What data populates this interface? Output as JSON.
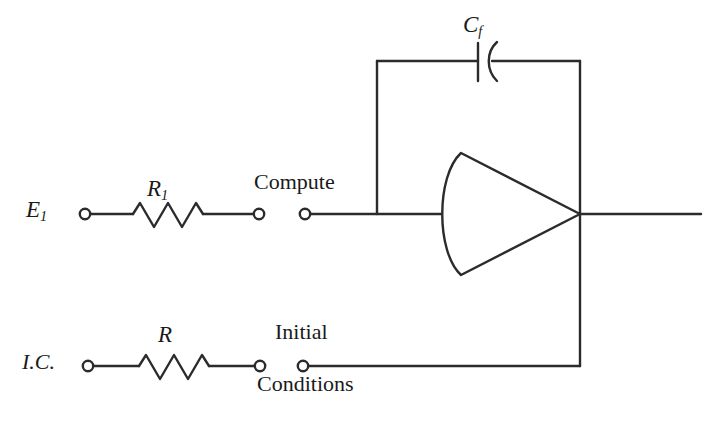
{
  "diagram": {
    "stroke_color": "#2b2b2b",
    "background_color": "#ffffff",
    "labels": {
      "input_source": "E",
      "input_source_sub": "1",
      "input_resistor": "R",
      "input_resistor_sub": "1",
      "ic_resistor": "R",
      "feedback_capacitor": "C",
      "feedback_capacitor_sub": "f",
      "ic_source": "I.C.",
      "compute_switch": "Compute",
      "initial_switch_line1": "Initial",
      "initial_switch_line2": "Conditions"
    },
    "components": [
      {
        "name": "input-source-terminal",
        "type": "terminal",
        "label": "E1"
      },
      {
        "name": "input-resistor",
        "type": "resistor",
        "label": "R1"
      },
      {
        "name": "compute-switch",
        "type": "open-switch",
        "label": "Compute"
      },
      {
        "name": "feedback-capacitor",
        "type": "capacitor",
        "label": "Cf"
      },
      {
        "name": "operational-amplifier",
        "type": "amplifier",
        "label": ""
      },
      {
        "name": "ic-source-terminal",
        "type": "terminal",
        "label": "I.C."
      },
      {
        "name": "ic-resistor",
        "type": "resistor",
        "label": "R"
      },
      {
        "name": "initial-conditions-switch",
        "type": "open-switch",
        "label": "Initial Conditions"
      },
      {
        "name": "output-line",
        "type": "wire",
        "label": ""
      }
    ]
  }
}
